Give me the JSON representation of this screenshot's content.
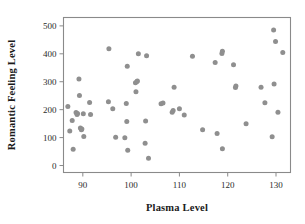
{
  "figure": {
    "background_color": "#ffffff",
    "frame_color": "#8a8a8a",
    "point_color": "#8f8f8f"
  },
  "chart_data": {
    "type": "scatter",
    "title": "",
    "xlabel": "Plasma Level",
    "ylabel": "Romantic Feeling Level",
    "xlim": [
      86,
      133
    ],
    "ylim": [
      -25,
      530
    ],
    "xticks": [
      90,
      100,
      110,
      120,
      130
    ],
    "yticks": [
      0,
      100,
      200,
      300,
      400,
      500
    ],
    "xtick_labels": [
      "90",
      "100",
      "110",
      "120",
      "130"
    ],
    "ytick_labels": [
      "0",
      "100",
      "200",
      "300",
      "400",
      "500"
    ],
    "grid": false,
    "legend": "none",
    "marker": "circle",
    "marker_color": "#8f8f8f",
    "n_points": 62,
    "points": [
      {
        "x": 86.9,
        "y": 211
      },
      {
        "x": 87.3,
        "y": 124
      },
      {
        "x": 87.8,
        "y": 161
      },
      {
        "x": 88.0,
        "y": 58
      },
      {
        "x": 88.6,
        "y": 190
      },
      {
        "x": 88.8,
        "y": 183
      },
      {
        "x": 88.9,
        "y": 186
      },
      {
        "x": 89.2,
        "y": 310
      },
      {
        "x": 89.3,
        "y": 251
      },
      {
        "x": 89.5,
        "y": 134
      },
      {
        "x": 89.7,
        "y": 128
      },
      {
        "x": 89.8,
        "y": 131
      },
      {
        "x": 90.1,
        "y": 185
      },
      {
        "x": 90.2,
        "y": 104
      },
      {
        "x": 91.4,
        "y": 226
      },
      {
        "x": 91.6,
        "y": 183
      },
      {
        "x": 95.3,
        "y": 228
      },
      {
        "x": 95.4,
        "y": 418
      },
      {
        "x": 96.2,
        "y": 203
      },
      {
        "x": 96.8,
        "y": 101
      },
      {
        "x": 98.7,
        "y": 99
      },
      {
        "x": 99.0,
        "y": 222
      },
      {
        "x": 99.1,
        "y": 158
      },
      {
        "x": 99.2,
        "y": 355
      },
      {
        "x": 99.3,
        "y": 55
      },
      {
        "x": 100.9,
        "y": 296
      },
      {
        "x": 101.0,
        "y": 264
      },
      {
        "x": 101.2,
        "y": 301
      },
      {
        "x": 101.3,
        "y": 303
      },
      {
        "x": 101.5,
        "y": 400
      },
      {
        "x": 102.9,
        "y": 80
      },
      {
        "x": 103.0,
        "y": 159
      },
      {
        "x": 103.2,
        "y": 393
      },
      {
        "x": 103.6,
        "y": 26
      },
      {
        "x": 106.2,
        "y": 221
      },
      {
        "x": 106.6,
        "y": 224
      },
      {
        "x": 108.5,
        "y": 191
      },
      {
        "x": 108.7,
        "y": 197
      },
      {
        "x": 108.9,
        "y": 280
      },
      {
        "x": 110.0,
        "y": 203
      },
      {
        "x": 111.0,
        "y": 181
      },
      {
        "x": 112.7,
        "y": 391
      },
      {
        "x": 114.8,
        "y": 128
      },
      {
        "x": 117.4,
        "y": 369
      },
      {
        "x": 117.8,
        "y": 115
      },
      {
        "x": 118.8,
        "y": 401
      },
      {
        "x": 118.9,
        "y": 409
      },
      {
        "x": 118.9,
        "y": 60
      },
      {
        "x": 121.2,
        "y": 361
      },
      {
        "x": 121.6,
        "y": 279
      },
      {
        "x": 121.7,
        "y": 285
      },
      {
        "x": 123.8,
        "y": 150
      },
      {
        "x": 126.9,
        "y": 280
      },
      {
        "x": 127.7,
        "y": 225
      },
      {
        "x": 129.2,
        "y": 103
      },
      {
        "x": 129.5,
        "y": 485
      },
      {
        "x": 129.6,
        "y": 292
      },
      {
        "x": 129.9,
        "y": 444
      },
      {
        "x": 130.4,
        "y": 191
      },
      {
        "x": 131.4,
        "y": 405
      }
    ]
  }
}
